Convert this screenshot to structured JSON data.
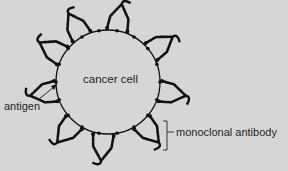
{
  "diagram": {
    "background_color": "#d6d6d6",
    "ink_color": "#111111",
    "cell": {
      "label": "cancer cell",
      "center": [
        108,
        82
      ],
      "radius": 52
    },
    "labels": {
      "antigen": "antigen",
      "monoclonal_antibody": "monoclonal antibody"
    },
    "antibody_count": 9,
    "antibody_angles_deg": [
      -120,
      -80,
      -35,
      10,
      50,
      95,
      130,
      170,
      210
    ]
  }
}
